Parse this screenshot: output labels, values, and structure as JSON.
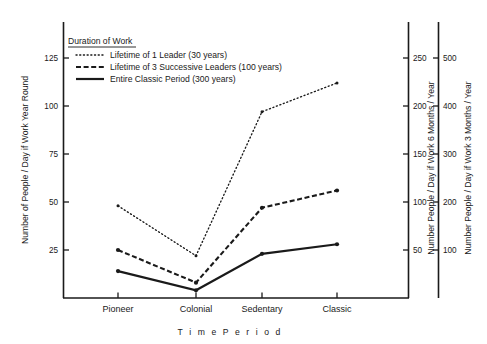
{
  "chart_data": {
    "type": "line",
    "title": "",
    "xlabel": "Time Period",
    "categories": [
      "Pioneer",
      "Colonial",
      "Sedentary",
      "Classic"
    ],
    "ylabel_left": "Number of People / Day if Work Year Round",
    "ylabel_right1": "Number People / Day if Work 6 Months / Year",
    "ylabel_right2": "Number People / Day if Work 3 Months / Year",
    "ylim_left": [
      0,
      137
    ],
    "yticks_left": [
      25,
      50,
      75,
      100,
      125
    ],
    "yticks_right1": [
      50,
      100,
      150,
      200,
      250
    ],
    "yticks_right2": [
      100,
      200,
      300,
      400,
      500
    ],
    "grid": false,
    "legend_position": "top-left",
    "legend_title": "Duration of Work",
    "series": [
      {
        "name": "Lifetime of 1 Leader (30 years)",
        "style": "dotted",
        "values": [
          48,
          22,
          97,
          112
        ]
      },
      {
        "name": "Lifetime of 3 Successive Leaders (100 years)",
        "style": "dashed",
        "values": [
          25,
          8,
          47,
          56
        ]
      },
      {
        "name": "Entire Classic Period (300 years)",
        "style": "solid",
        "values": [
          14,
          4,
          23,
          28
        ]
      }
    ]
  },
  "axes": {
    "left": {
      "title": "Number of People / Day if Work Year Round",
      "ticks": [
        "125",
        "100",
        "75",
        "50",
        "25"
      ]
    },
    "right1": {
      "title": "Number People / Day if Work 6 Months / Year",
      "ticks": [
        "250",
        "200",
        "150",
        "100",
        "50"
      ]
    },
    "right2": {
      "title": "Number People / Day if Work 3 Months / Year",
      "ticks": [
        "500",
        "400",
        "300",
        "200",
        "100"
      ]
    },
    "x": {
      "title": "T i m e   P e r i o d",
      "categories": [
        "Pioneer",
        "Colonial",
        "Sedentary",
        "Classic"
      ]
    }
  },
  "legend": {
    "title": "Duration of Work",
    "items": [
      {
        "label": "Lifetime of 1 Leader (30 years)",
        "style": "dotted"
      },
      {
        "label": "Lifetime of 3 Successive Leaders (100 years)",
        "style": "dashed"
      },
      {
        "label": "Entire Classic Period (300 years)",
        "style": "solid"
      }
    ]
  },
  "colors": {
    "ink": "#1a1a1a",
    "background": "#ffffff"
  }
}
